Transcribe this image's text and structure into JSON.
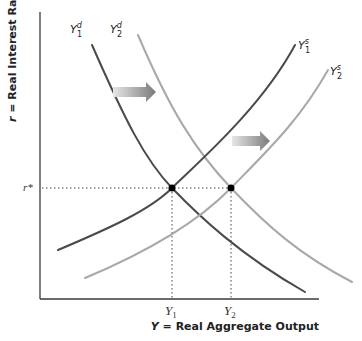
{
  "diagram": {
    "y_axis_label": "r = Real Interest Rate",
    "y_axis_label_var": "r",
    "y_axis_label_rest": " = Real Interest Rate",
    "x_axis_label_var": "Y",
    "x_axis_label_rest": " = Real Aggregate Output",
    "r_star_label": "r*",
    "y1_tick": {
      "base": "Y",
      "sub": "1"
    },
    "y2_tick": {
      "base": "Y",
      "sub": "2"
    },
    "colors": {
      "dark_curve": "#4a4a4a",
      "light_curve": "#a8a8a8",
      "axis": "#3a3a3a",
      "arrow_start": "#e6e6e6",
      "arrow_end": "#7a7a7a",
      "point": "#000000"
    },
    "curves": [
      {
        "id": "Y1d",
        "name": "Y1 demand",
        "label_base": "Y",
        "label_sub": "1",
        "label_sup": "d",
        "shade": "dark",
        "label_pos": [
          70,
          33
        ],
        "path": "M92,45 C125,120 145,160 172,188 S240,255 305,292"
      },
      {
        "id": "Y2d",
        "name": "Y2 demand",
        "label_base": "Y",
        "label_sub": "2",
        "label_sup": "d",
        "shade": "light",
        "label_pos": [
          110,
          33
        ],
        "path": "M138,35 C170,110 195,150 231,188 S300,255 352,282"
      },
      {
        "id": "Y1s",
        "name": "Y1 supply",
        "label_base": "Y",
        "label_sub": "1",
        "label_sup": "s",
        "shade": "dark",
        "label_pos": [
          298,
          49
        ],
        "path": "M58,250 C110,228 150,210 172,188 S260,110 295,45"
      },
      {
        "id": "Y2s",
        "name": "Y2 supply",
        "label_base": "Y",
        "label_sub": "2",
        "label_sup": "s",
        "shade": "light",
        "label_pos": [
          330,
          75
        ],
        "path": "M85,278 C140,255 195,225 231,188 S300,120 328,70"
      }
    ],
    "equilibria": [
      {
        "name": "initial-equilibrium",
        "x": 172,
        "y": 188
      },
      {
        "name": "new-equilibrium",
        "x": 231,
        "y": 188
      }
    ],
    "shift_arrows": [
      {
        "name": "demand-shift-arrow",
        "x1": 113,
        "x2": 156,
        "y": 92
      },
      {
        "name": "supply-shift-arrow",
        "x1": 232,
        "x2": 270,
        "y": 141
      }
    ],
    "axes": {
      "origin_x": 40,
      "origin_y": 299,
      "top_y": 12,
      "right_x": 319
    }
  }
}
